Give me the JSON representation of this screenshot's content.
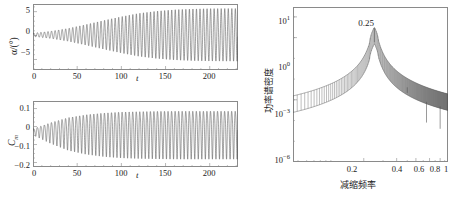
{
  "figure": {
    "panels": [
      "alpha-time-history",
      "cm-time-history",
      "power-spectral-density"
    ]
  },
  "panel_alpha": {
    "ylabel": "α/(°)",
    "xlabel": "t",
    "yticks": [
      "5",
      "0",
      "−5"
    ],
    "ytick_values": [
      5,
      0,
      -5
    ],
    "xticks": [
      "0",
      "50",
      "100",
      "150",
      "200"
    ],
    "xtick_values": [
      0,
      50,
      100,
      150,
      200
    ]
  },
  "panel_cm": {
    "ylabel_main": "C",
    "ylabel_sub": "m",
    "xlabel": "t",
    "yticks": [
      "0.1",
      "0",
      "−0.1",
      "−0.2"
    ],
    "ytick_values": [
      0.1,
      0,
      -0.1,
      -0.2
    ],
    "xticks": [
      "0",
      "50",
      "100",
      "150",
      "200"
    ],
    "xtick_values": [
      0,
      50,
      100,
      150,
      200
    ]
  },
  "panel_psd": {
    "ylabel": "功率谱密度",
    "xlabel": "减缩频率",
    "peak_annotation": "0.25",
    "yticks": [
      {
        "mantissa": "10",
        "exponent": "1"
      },
      {
        "mantissa": "10",
        "exponent": "0"
      },
      {
        "mantissa": "10",
        "exponent": "−3"
      },
      {
        "mantissa": "10",
        "exponent": "−6"
      }
    ],
    "xticks": [
      "0.2",
      "0.4",
      "0.6",
      "0.8",
      "1"
    ],
    "xtick_values": [
      0.2,
      0.4,
      0.6,
      0.8,
      1.0
    ]
  },
  "colors": {
    "curve": "#555555",
    "axis": "#8a8a8a",
    "text": "#1c1c1c",
    "background": "#ffffff"
  },
  "chart_data": [
    {
      "type": "line",
      "name": "alpha-time-history",
      "title": "",
      "xlabel": "t",
      "ylabel": "α/(°)",
      "xlim": [
        0,
        232
      ],
      "ylim": [
        -7.2,
        6.6
      ],
      "grid": false,
      "legend": null,
      "description": "Divergent pitch oscillation growing from near-zero initial amplitude to a saturated limit cycle of about ±5.5 degrees.",
      "envelope": {
        "initial_amplitude": 0.35,
        "final_amplitude": 5.5,
        "growth_rate": 0.028,
        "period": 4.0,
        "mean": 0.15
      },
      "envelope_samples": {
        "t": [
          0,
          20,
          40,
          60,
          80,
          100,
          120,
          140,
          160,
          180,
          200,
          220,
          232
        ],
        "amplitude": [
          0.35,
          0.75,
          1.35,
          2.15,
          3.0,
          3.8,
          4.5,
          4.95,
          5.25,
          5.4,
          5.48,
          5.5,
          5.5
        ]
      }
    },
    {
      "type": "line",
      "name": "cm-time-history",
      "title": "",
      "xlabel": "t",
      "ylabel": "Cm",
      "xlim": [
        0,
        232
      ],
      "ylim": [
        -0.225,
        0.142
      ],
      "grid": false,
      "legend": null,
      "description": "Moment coefficient oscillation, asymmetric about a slightly negative mean, growing to a saturated limit cycle between about +0.115 and −0.17.",
      "envelope": {
        "mean": -0.028,
        "initial_amplitude": 0.018,
        "final_amplitude_positive": 0.143,
        "final_amplitude_negative": 0.142,
        "growth_rate": 0.04,
        "period": 4.0
      },
      "envelope_samples": {
        "t": [
          0,
          20,
          40,
          60,
          80,
          100,
          120,
          140,
          160,
          180,
          200,
          220,
          232
        ],
        "amplitude": [
          0.018,
          0.062,
          0.098,
          0.118,
          0.13,
          0.137,
          0.14,
          0.142,
          0.143,
          0.143,
          0.143,
          0.143,
          0.143
        ]
      }
    },
    {
      "type": "line",
      "name": "power-spectral-density",
      "title": "",
      "xlabel": "减缩频率",
      "ylabel": "功率谱密度",
      "xscale": "log",
      "yscale": "log",
      "xlim": [
        0.045,
        1.18
      ],
      "ylim": [
        1e-06,
        30
      ],
      "grid": false,
      "legend": null,
      "annotations": [
        {
          "text": "0.25",
          "x": 0.25,
          "y": 8
        }
      ],
      "description": "Log-log power spectral density with a dominant fundamental peak at reduced frequency 0.25 and harmonic peaks at 0.5, 0.75 and 1.0, superimposed on a dense comb of closely spaced spectral lines.",
      "peaks": [
        {
          "frequency": 0.25,
          "psd": 3.0,
          "label": "fundamental"
        },
        {
          "frequency": 0.5,
          "psd": 0.004,
          "label": "2nd harmonic"
        },
        {
          "frequency": 0.75,
          "psd": 8e-05,
          "label": "3rd harmonic"
        },
        {
          "frequency": 1.0,
          "psd": 4e-05,
          "label": "4th harmonic"
        }
      ],
      "baseline": {
        "f": [
          0.05,
          0.08,
          0.12,
          0.17,
          0.22,
          0.25,
          0.28,
          0.35,
          0.45,
          0.55,
          0.7,
          0.85,
          1.0,
          1.15
        ],
        "psd": [
          1.2e-05,
          1.4e-05,
          2e-05,
          4e-05,
          0.00025,
          3.0,
          0.0003,
          5e-05,
          1.6e-05,
          7e-06,
          3.2e-06,
          2e-06,
          1.5e-06,
          1.2e-06
        ]
      }
    }
  ]
}
